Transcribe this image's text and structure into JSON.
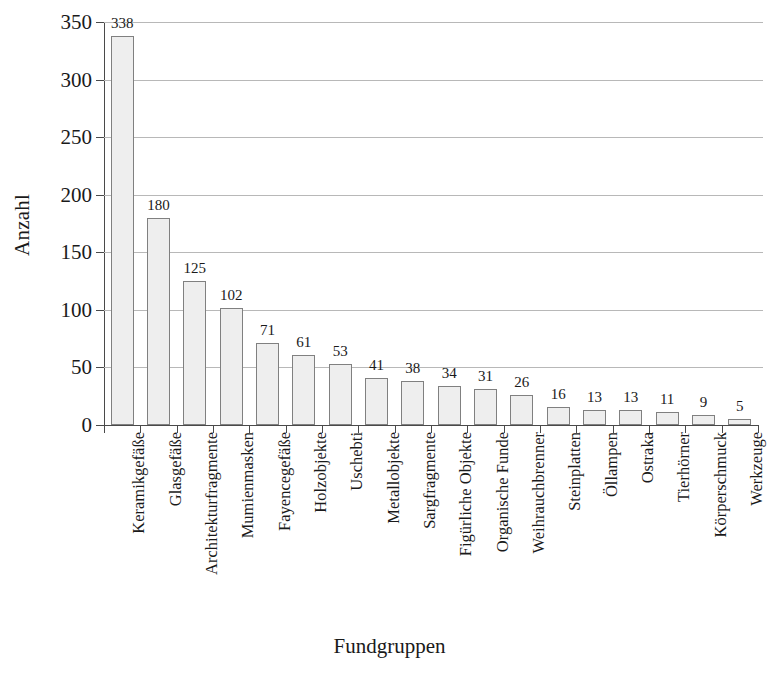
{
  "chart_data": {
    "type": "bar",
    "title": "",
    "xlabel": "Fundgruppen",
    "ylabel": "Anzahl",
    "ylim": [
      0,
      350
    ],
    "ytick_step": 50,
    "yticks": [
      0,
      50,
      100,
      150,
      200,
      250,
      300,
      350
    ],
    "grid": "horizontal",
    "legend": "none",
    "bar_fill_color": "#eeeeee",
    "bar_border_color": "#808080",
    "axis_color": "#4a4a4a",
    "gridline_color": "#b8b8b8",
    "categories": [
      "Keramikgefäße",
      "Glasgefäße",
      "Architekturfragmente",
      "Mumienmasken",
      "Fayencegefäße",
      "Holzobjekte",
      "Uschebti",
      "Metallobjekte",
      "Sargfragmente",
      "Figürliche Objekte",
      "Organische Funde",
      "Weihrauchbrenner",
      "Steinplatten",
      "Öllampen",
      "Ostraka",
      "Tierhörner",
      "Körperschmuck",
      "Werkzeuge"
    ],
    "values": [
      338,
      180,
      125,
      102,
      71,
      61,
      53,
      41,
      38,
      34,
      31,
      26,
      16,
      13,
      13,
      11,
      9,
      5
    ]
  }
}
